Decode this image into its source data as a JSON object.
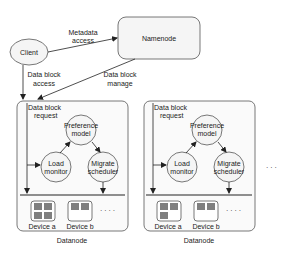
{
  "diagram": {
    "client": {
      "label": "Client"
    },
    "namenode": {
      "label": "Namenode"
    },
    "edges": {
      "metadata_access": [
        "Metadata",
        "access"
      ],
      "data_block_access": [
        "Data block",
        "access"
      ],
      "data_block_manage": [
        "Data block",
        "manage"
      ]
    },
    "datanodes": [
      {
        "label": "Datanode",
        "request_label": [
          "Data block",
          "request"
        ],
        "preference_model": [
          "Preference",
          "model"
        ],
        "load_monitor": [
          "Load",
          "monitor"
        ],
        "migrate_scheduler": [
          "Migrate",
          "scheduler"
        ],
        "devices": [
          {
            "label": "Device a"
          },
          {
            "label": "Device b"
          }
        ],
        "more": "· · · ·"
      },
      {
        "label": "Datanode",
        "request_label": [
          "Data block",
          "request"
        ],
        "preference_model": [
          "Preference",
          "model"
        ],
        "load_monitor": [
          "Load",
          "monitor"
        ],
        "migrate_scheduler": [
          "Migrate",
          "scheduler"
        ],
        "devices": [
          {
            "label": "Device a"
          },
          {
            "label": "Device b"
          }
        ],
        "more": "· · · ·"
      }
    ],
    "ellipsis": "· · ·",
    "colors": {
      "stroke": "#444444",
      "node_fill": "#f5f5f5",
      "container_fill": "#fafafa",
      "block_fill": "#7f7f7f"
    }
  }
}
